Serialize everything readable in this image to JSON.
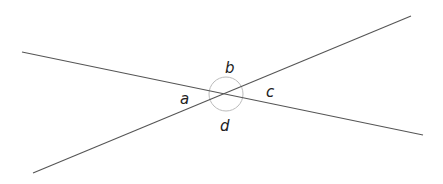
{
  "diagram": {
    "type": "intersecting-lines-angles",
    "colors": {
      "line": "#555555",
      "arc": "#bbbbbb",
      "label": "#222222",
      "background": "#ffffff"
    },
    "lines": [
      {
        "id": "line-1",
        "x1": 22,
        "y1": 52,
        "x2": 423,
        "y2": 135
      },
      {
        "id": "line-2",
        "x1": 33,
        "y1": 173,
        "x2": 411,
        "y2": 16
      }
    ],
    "intersection": {
      "x": 226,
      "y": 94
    },
    "angle_circle_radius": 17,
    "labels": {
      "a": "a",
      "b": "b",
      "c": "c",
      "d": "d"
    },
    "label_positions": {
      "a": {
        "x": 180,
        "y": 104
      },
      "b": {
        "x": 225,
        "y": 73
      },
      "c": {
        "x": 266,
        "y": 97
      },
      "d": {
        "x": 220,
        "y": 131
      }
    }
  }
}
